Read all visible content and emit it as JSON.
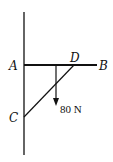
{
  "diagram": {
    "type": "statics-truss",
    "labels": {
      "A": "A",
      "B": "B",
      "C": "C",
      "D": "D"
    },
    "load": {
      "label": "80 N",
      "direction": "down"
    },
    "colors": {
      "line": "#111111",
      "background": "#ffffff"
    }
  }
}
